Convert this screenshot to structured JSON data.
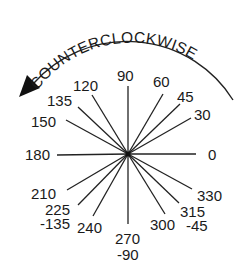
{
  "diagram": {
    "title": "COUNTERCLOCKWISE",
    "direction_arrow": "counterclockwise-arrow",
    "center": {
      "x": 128,
      "y": 154
    },
    "stroke_color": "#222222",
    "text_color": "#1a1a1a",
    "background": "#ffffff",
    "spokes": [
      {
        "angle": 0,
        "label": "0",
        "alt_label": ""
      },
      {
        "angle": 30,
        "label": "30",
        "alt_label": ""
      },
      {
        "angle": 45,
        "label": "45",
        "alt_label": ""
      },
      {
        "angle": 60,
        "label": "60",
        "alt_label": ""
      },
      {
        "angle": 90,
        "label": "90",
        "alt_label": ""
      },
      {
        "angle": 120,
        "label": "120",
        "alt_label": ""
      },
      {
        "angle": 135,
        "label": "135",
        "alt_label": ""
      },
      {
        "angle": 150,
        "label": "150",
        "alt_label": ""
      },
      {
        "angle": 180,
        "label": "180",
        "alt_label": ""
      },
      {
        "angle": 210,
        "label": "210",
        "alt_label": ""
      },
      {
        "angle": 225,
        "label": "225",
        "alt_label": "-135"
      },
      {
        "angle": 240,
        "label": "240",
        "alt_label": ""
      },
      {
        "angle": 270,
        "label": "270",
        "alt_label": "-90"
      },
      {
        "angle": 300,
        "label": "300",
        "alt_label": ""
      },
      {
        "angle": 315,
        "label": "315",
        "alt_label": "-45"
      },
      {
        "angle": 330,
        "label": "330",
        "alt_label": ""
      }
    ]
  }
}
